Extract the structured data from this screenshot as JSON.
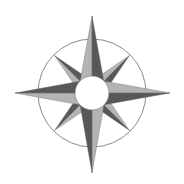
{
  "image": {
    "subject": "compass-rose",
    "description": "Eight-pointed compass rose with shaded half-arms, outer ring and white center disc"
  },
  "colors": {
    "background": "#ffffff",
    "dark": "#585858",
    "light": "#b4b4b4",
    "ring": "#8c8c8c",
    "center": "#ffffff",
    "edge": "#6e6e6e"
  },
  "geometry": {
    "center": [
      92,
      93
    ],
    "ring_radius": 54,
    "center_radius": 17,
    "main_arm_length": 77,
    "main_arm_base": 14,
    "diag_arm_length": 53,
    "diag_arm_base": 10
  }
}
